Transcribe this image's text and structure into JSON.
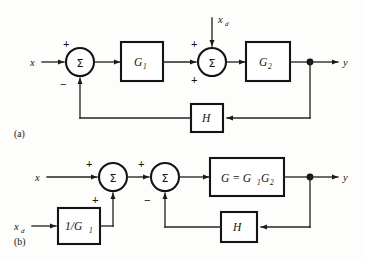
{
  "figure": {
    "type": "control-system-block-diagram",
    "background_color": "#fdfdfb",
    "line_color": "#242424",
    "panels": [
      {
        "id": "a",
        "panel_label": "(a)",
        "panel_label_pos": {
          "x": 14,
          "y": 135
        },
        "description": "Cascade G1 then G2 with disturbance xd injected between them and unity-path H feedback",
        "inputs": [
          {
            "name": "reference-input",
            "label": "x",
            "x": 32,
            "y": 66
          },
          {
            "name": "disturbance-input",
            "label": "x",
            "sub": "d",
            "x": 218,
            "y": 22
          }
        ],
        "outputs": [
          {
            "name": "output",
            "label": "y",
            "x": 345,
            "y": 66
          }
        ],
        "summing_junctions": [
          {
            "name": "summing-junction-1",
            "symbol": "Σ",
            "cx": 80,
            "cy": 62,
            "r": 14,
            "signs": [
              {
                "sign": "+",
                "x": 63,
                "y": 44
              },
              {
                "sign": "−",
                "x": 62,
                "y": 86
              }
            ]
          },
          {
            "name": "summing-junction-2",
            "symbol": "Σ",
            "cx": 212,
            "cy": 62,
            "r": 14,
            "signs": [
              {
                "sign": "+",
                "x": 192,
                "y": 45
              },
              {
                "sign": "+",
                "x": 192,
                "y": 83
              }
            ]
          }
        ],
        "blocks": [
          {
            "name": "block-g1",
            "label": "G",
            "sub": "1",
            "x": 121,
            "y": 42,
            "w": 42,
            "h": 39
          },
          {
            "name": "block-g2",
            "label": "G",
            "sub": "2",
            "x": 246,
            "y": 42,
            "w": 44,
            "h": 39
          },
          {
            "name": "block-h",
            "label": "H",
            "sub": "",
            "x": 191,
            "y": 104,
            "w": 32,
            "h": 28
          }
        ],
        "nodes": [
          {
            "name": "output-takeoff-node",
            "x": 310,
            "y": 62,
            "r": 3.4
          }
        ],
        "feedback_path_y": 118
      },
      {
        "id": "b",
        "panel_label": "(b)",
        "panel_label_pos": {
          "x": 14,
          "y": 243
        },
        "description": "Equivalent form: disturbance xd passed through 1/G1 into first summer, combined plant G = G1G2, H feedback",
        "inputs": [
          {
            "name": "reference-input",
            "label": "x",
            "x": 37,
            "y": 181
          },
          {
            "name": "disturbance-input",
            "label": "x",
            "sub": "d",
            "x": 16,
            "y": 222
          }
        ],
        "outputs": [
          {
            "name": "output",
            "label": "y",
            "x": 345,
            "y": 181
          }
        ],
        "summing_junctions": [
          {
            "name": "summing-junction-1",
            "symbol": "Σ",
            "cx": 113,
            "cy": 177,
            "r": 14,
            "signs": [
              {
                "sign": "+",
                "x": 88,
                "y": 165
              },
              {
                "sign": "+",
                "x": 93,
                "y": 201
              }
            ]
          },
          {
            "name": "summing-junction-2",
            "symbol": "Σ",
            "cx": 165,
            "cy": 177,
            "r": 14,
            "signs": [
              {
                "sign": "+",
                "x": 140,
                "y": 165
              },
              {
                "sign": "−",
                "x": 146,
                "y": 201
              }
            ]
          }
        ],
        "blocks": [
          {
            "name": "block-inverse-g1",
            "label": "1/G",
            "sub": "1",
            "x": 58,
            "y": 208,
            "w": 42,
            "h": 36
          },
          {
            "name": "block-g-combined",
            "label": "G = G",
            "sub": "1",
            "label2": "G",
            "sub2": "2",
            "x": 210,
            "y": 158,
            "w": 74,
            "h": 38
          },
          {
            "name": "block-h",
            "label": "H",
            "sub": "",
            "x": 221,
            "y": 212,
            "w": 36,
            "h": 30
          }
        ],
        "nodes": [
          {
            "name": "output-takeoff-node",
            "x": 310,
            "y": 177,
            "r": 3.4
          }
        ],
        "feedback_path_y": 227,
        "disturbance_path_y": 226
      }
    ]
  }
}
